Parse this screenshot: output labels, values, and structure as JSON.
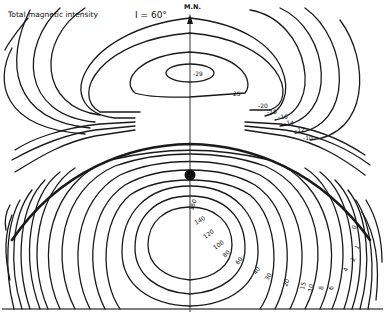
{
  "figure": {
    "title": "Total magnetic intensity",
    "inclination_label": "I = 60°",
    "north_label": "M.N.",
    "north_arrow_icon": "arrow-up-icon",
    "source_marker_icon": "dipole-source-dot"
  },
  "contours": {
    "negative_lobe_labels": [
      "-29",
      "25",
      "-20",
      "-18",
      "-16",
      "-14",
      "-12",
      "-10"
    ],
    "positive_lobe_labels": [
      "160",
      "140",
      "120",
      "100",
      "80",
      "60",
      "40",
      "30",
      "20",
      "15",
      "10",
      "8",
      "6",
      "4",
      "2",
      "1",
      "0"
    ],
    "zero_contour": "thick line"
  }
}
